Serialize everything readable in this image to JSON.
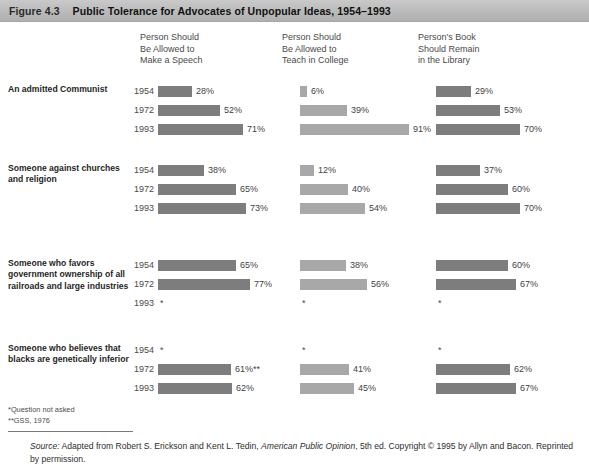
{
  "header": {
    "figure_number": "Figure 4.3",
    "title": "Public Tolerance for Advocates of Unpopular Ideas, 1954–1993"
  },
  "columns": [
    {
      "label": "Person Should\nBe Allowed to\nMake a Speech",
      "color": "#7d7d7d"
    },
    {
      "label": "Person Should\nBe Allowed to\nTeach in College",
      "color": "#a8a8a8"
    },
    {
      "label": "Person's Book\nShould Remain\nin the Library",
      "color": "#7d7d7d"
    }
  ],
  "groups": [
    {
      "label": "An admitted Communist",
      "years": [
        "1954",
        "1972",
        "1993"
      ],
      "values": [
        [
          "28%",
          "52%",
          "71%"
        ],
        [
          "6%",
          "39%",
          "91%"
        ],
        [
          "29%",
          "53%",
          "70%"
        ]
      ]
    },
    {
      "label": "Someone against churches and religion",
      "years": [
        "1954",
        "1972",
        "1993"
      ],
      "values": [
        [
          "38%",
          "65%",
          "73%"
        ],
        [
          "12%",
          "40%",
          "54%"
        ],
        [
          "37%",
          "60%",
          "70%"
        ]
      ]
    },
    {
      "label": "Someone who favors government ownership of all railroads and large industries",
      "years": [
        "1954",
        "1972",
        "1993"
      ],
      "values": [
        [
          "65%",
          "77%",
          "*"
        ],
        [
          "38%",
          "56%",
          "*"
        ],
        [
          "60%",
          "67%",
          "*"
        ]
      ]
    },
    {
      "label": "Someone who believes that blacks are genetically inferior",
      "years": [
        "1954",
        "1972",
        "1993"
      ],
      "values": [
        [
          "*",
          "61%**",
          "62%"
        ],
        [
          "*",
          "41%",
          "45%"
        ],
        [
          "*",
          "62%",
          "67%"
        ]
      ]
    }
  ],
  "footnotes": "*Question not asked\n**GSS, 1976",
  "source": {
    "prefix": "Source:",
    "text_1": " Adapted from Robert S. Erickson and Kent L. Tedin, ",
    "work": "American Public Opinion",
    "text_2": ", 5th ed. Copyright © 1995 by Allyn and Bacon. Reprinted by permission."
  },
  "chart_data": {
    "type": "bar",
    "title": "Public Tolerance for Advocates of Unpopular Ideas, 1954–1993",
    "xlabel": "Percent",
    "ylabel": "",
    "xlim": [
      0,
      100
    ],
    "grid": false,
    "legend": "none",
    "orientation": "horizontal",
    "categories": [
      "An admitted Communist",
      "Someone against churches and religion",
      "Someone who favors government ownership of all railroads and large industries",
      "Someone who believes that blacks are genetically inferior"
    ],
    "years": [
      "1954",
      "1972",
      "1993"
    ],
    "series": [
      {
        "name": "Person Should Be Allowed to Make a Speech",
        "values": [
          [
            28,
            52,
            71
          ],
          [
            38,
            65,
            73
          ],
          [
            65,
            77,
            null
          ],
          [
            null,
            61,
            62
          ]
        ]
      },
      {
        "name": "Person Should Be Allowed to Teach in College",
        "values": [
          [
            6,
            39,
            91
          ],
          [
            12,
            40,
            54
          ],
          [
            38,
            56,
            null
          ],
          [
            null,
            41,
            45
          ]
        ]
      },
      {
        "name": "Person's Book Should Remain in the Library",
        "values": [
          [
            29,
            53,
            70
          ],
          [
            37,
            60,
            70
          ],
          [
            60,
            67,
            null
          ],
          [
            null,
            62,
            67
          ]
        ]
      }
    ],
    "annotations": [
      "*Question not asked",
      "**GSS, 1976"
    ]
  }
}
